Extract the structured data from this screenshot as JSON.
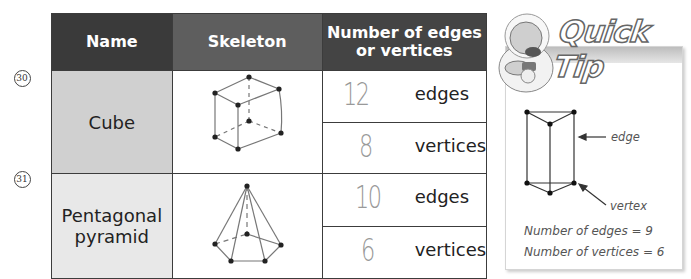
{
  "table": {
    "headers": {
      "name": "Name",
      "skeleton": "Skeleton",
      "number": "Number of edges or vertices",
      "number_line1": "Number of edges",
      "number_line2": "or vertices"
    },
    "rows": [
      {
        "question_number": "30",
        "name": "Cube",
        "name_line1": "Cube",
        "name_line2": "",
        "skeleton_icon": "cube-skeleton",
        "edges_value": "12",
        "edges_label": "edges",
        "vertices_value": "8",
        "vertices_label": "vertices"
      },
      {
        "question_number": "31",
        "name": "Pentagonal pyramid",
        "name_line1": "Pentagonal",
        "name_line2": "pyramid",
        "skeleton_icon": "pentagonal-pyramid-skeleton",
        "edges_value": "10",
        "edges_label": "edges",
        "vertices_value": "6",
        "vertices_label": "vertices"
      }
    ]
  },
  "quick_tip": {
    "title": "Quick Tip",
    "diagram_icon": "triangular-prism-skeleton",
    "edge_label": "edge",
    "vertex_label": "vertex",
    "edges_note": "Number of edges = 9",
    "vertices_note": "Number of vertices = 6"
  },
  "colors": {
    "header_dark": "#3a3a3a",
    "header_mid": "#5e5e5e",
    "cube_name_bg": "#d0d0d0",
    "pyramid_name_bg": "#e8e8e8",
    "handwriting": "#999999"
  }
}
